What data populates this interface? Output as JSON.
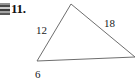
{
  "problem": {
    "number_label": "11."
  },
  "artifact": {
    "icon_name": "scan-thumbnail-artifact"
  },
  "figure": {
    "type": "triangle",
    "stroke_color": "#6e6e6e",
    "stroke_width": 1,
    "vertices": {
      "left": {
        "x": 37,
        "y": 61
      },
      "apex": {
        "x": 71,
        "y": 4
      },
      "right": {
        "x": 135,
        "y": 57
      }
    },
    "side_labels": [
      {
        "id": "left-side",
        "text": "12",
        "x": 36,
        "y": 25
      },
      {
        "id": "right-side",
        "text": "18",
        "x": 104,
        "y": 18
      },
      {
        "id": "bottom-side",
        "text": "6",
        "x": 35,
        "y": 69
      }
    ]
  }
}
